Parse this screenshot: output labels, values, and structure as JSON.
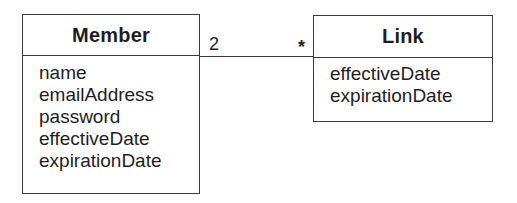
{
  "diagram": {
    "type": "uml-class-diagram",
    "classes": [
      {
        "name": "Member",
        "attributes": [
          "name",
          "emailAddress",
          "password",
          "effectiveDate",
          "expirationDate"
        ]
      },
      {
        "name": "Link",
        "attributes": [
          "effectiveDate",
          "expirationDate"
        ]
      }
    ],
    "associations": [
      {
        "from": "Member",
        "to": "Link",
        "from_multiplicity": "2",
        "to_multiplicity": "*"
      }
    ],
    "colors": {
      "line": "#3a3a3a",
      "text": "#1e1e1e",
      "background": "#ffffff"
    }
  }
}
